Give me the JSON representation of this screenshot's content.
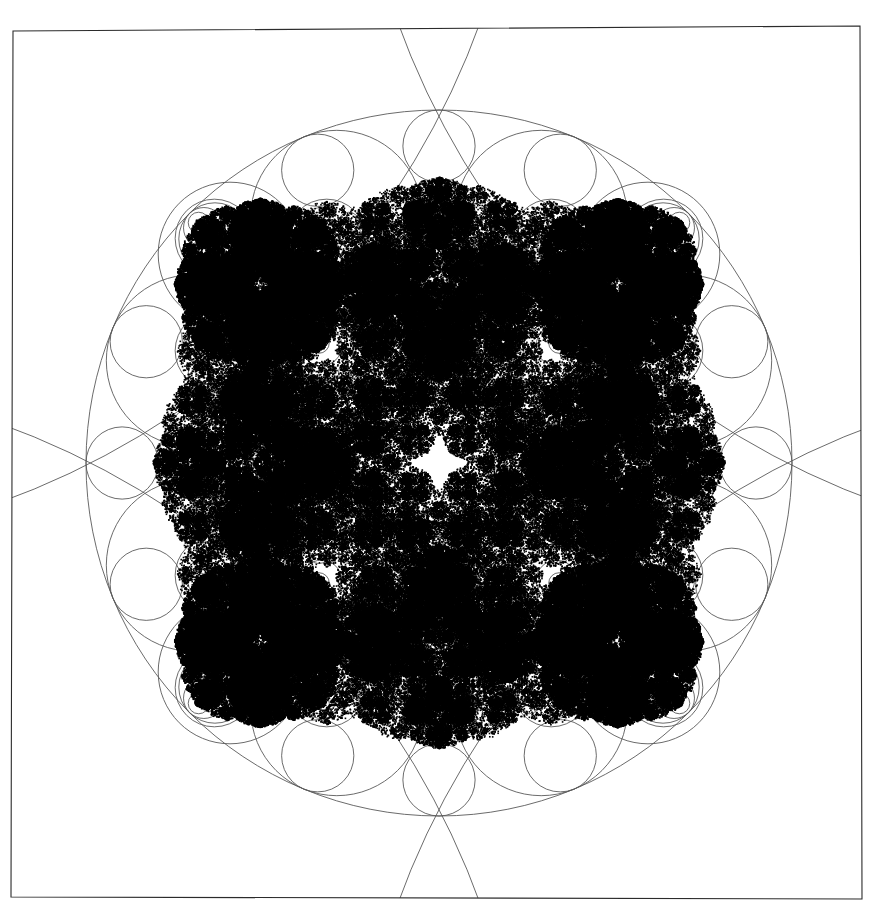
{
  "figure": {
    "title": "Kleinian group limit set with Schottky circles",
    "caption": "",
    "width": 888,
    "height": 919,
    "background_color": "#ffffff",
    "ink_color": "#000000",
    "circle_stroke_color": "#5a5a5a",
    "frame_stroke_color": "#2b2b2b",
    "circle_stroke_width": 0.9,
    "frame_stroke_width": 1.1
  },
  "frame": {
    "name": "plot-border",
    "corners": [
      {
        "x": 13,
        "y": 31
      },
      {
        "x": 860,
        "y": 26
      },
      {
        "x": 862,
        "y": 899
      },
      {
        "x": 11,
        "y": 897
      }
    ]
  },
  "chart_data": {
    "type": "scatter",
    "title": "Kleinian group limit set with Schottky circles",
    "xlabel": "",
    "ylabel": "",
    "xlim": [
      -1.25,
      1.25
    ],
    "ylim": [
      -1.25,
      1.25
    ],
    "grid": false,
    "legend": "none",
    "symmetry_order": 4,
    "point_color": "#000000",
    "point_size": 1.6,
    "iterations": 260000,
    "generators": [
      {
        "name": "a",
        "a_re": 1.0,
        "a_im": 0.0,
        "b_re": 0.0,
        "b_im": -1.0,
        "c_re": 0.0,
        "c_im": -1.0,
        "d_re": 1.0,
        "d_im": 0.0
      },
      {
        "name": "A_inv",
        "a_re": 1.0,
        "a_im": 0.0,
        "b_re": 0.0,
        "b_im": 1.0,
        "c_re": 0.0,
        "c_im": 1.0,
        "d_re": 1.0,
        "d_im": 0.0
      },
      {
        "name": "b",
        "a_re": 1.0,
        "a_im": 0.0,
        "b_re": 1.0,
        "b_im": 0.0,
        "c_re": 1.0,
        "c_im": 0.0,
        "d_re": 1.0,
        "d_im": 0.0
      },
      {
        "name": "B_inv",
        "a_re": 1.0,
        "a_im": 0.0,
        "b_re": -1.0,
        "b_im": 0.0,
        "c_re": -1.0,
        "c_im": 0.0,
        "d_re": 1.0,
        "d_im": 0.0
      }
    ],
    "circles": {
      "description": "Schottky / isometric circles of the group, in figure coordinates (pixels).",
      "big_central": {
        "cx": 439,
        "cy": 463,
        "r": 353
      },
      "corner_arcs": [
        {
          "name": "arc-top-left",
          "cx": -272,
          "cy": -250,
          "r": 800
        },
        {
          "name": "arc-top-right",
          "cx": 1150,
          "cy": -250,
          "r": 800
        },
        {
          "name": "arc-bottom-left",
          "cx": -272,
          "cy": 1176,
          "r": 800
        },
        {
          "name": "arc-bottom-right",
          "cx": 1150,
          "cy": 1176,
          "r": 800
        }
      ],
      "ring_large_count": 8,
      "ring_large_radius": 86,
      "lattice_levels": 4
    }
  }
}
